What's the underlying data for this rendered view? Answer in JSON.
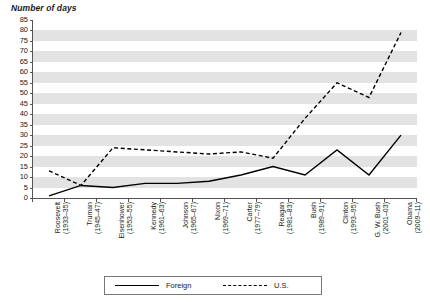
{
  "chart_data": {
    "type": "line",
    "title": "",
    "ylabel": "Number of days",
    "xlabel": "",
    "ylim": [
      0,
      85
    ],
    "ytick_step": 5,
    "grid": "horizontal-banded",
    "legend_position": "bottom",
    "categories": [
      "Roosevelt (1933–35)",
      "Truman (1945–47)",
      "Eisenhower (1953–55)",
      "Kennedy (1961–63)",
      "Johnson (1965–67)",
      "Nixon (1969–71)",
      "Carter (1977–79)",
      "Reagan (1981–83)",
      "Bush (1989–91)",
      "Clinton (1993–95)",
      "G. W. Bush (2001–03)",
      "Obama (2009–11)"
    ],
    "category_lines": [
      [
        "Roosevelt",
        "(1933–35)"
      ],
      [
        "Truman",
        "(1945–47)"
      ],
      [
        "Eisenhower",
        "(1953–55)"
      ],
      [
        "Kennedy",
        "(1961–63)"
      ],
      [
        "Johnson",
        "(1965–67)"
      ],
      [
        "Nixon",
        "(1969–71)"
      ],
      [
        "Carter",
        "(1977–79)"
      ],
      [
        "Reagan",
        "(1981–83)"
      ],
      [
        "Bush",
        "(1989–91)"
      ],
      [
        "Clinton",
        "(1993–95)"
      ],
      [
        "G. W. Bush",
        "(2001–03)"
      ],
      [
        "Obama",
        "(2009–11)"
      ]
    ],
    "ytick_labels": [
      "0",
      "5",
      "10",
      "15",
      "20",
      "25",
      "30",
      "35",
      "40",
      "45",
      "50",
      "55",
      "60",
      "65",
      "70",
      "75",
      "80",
      "85"
    ],
    "series": [
      {
        "name": "Foreign",
        "style": "solid",
        "color": "#000000",
        "values": [
          1,
          6,
          5,
          7,
          7,
          8,
          11,
          15,
          11,
          23,
          11,
          30
        ]
      },
      {
        "name": "U.S.",
        "style": "dashed",
        "color": "#000000",
        "values": [
          13,
          6,
          24,
          23,
          22,
          21,
          22,
          19,
          38,
          55,
          48,
          85
        ]
      }
    ],
    "series_note_obama_us": 79
  },
  "legend": {
    "foreign_label": "Foreign",
    "us_label": "U.S."
  }
}
